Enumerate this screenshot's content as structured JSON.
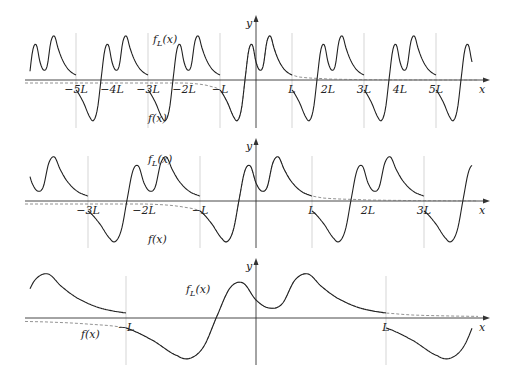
{
  "figure": {
    "panels": [
      {
        "id": "panel-1",
        "axis_y": 80,
        "origin_x": 256,
        "L_px": 36,
        "y_top": 15,
        "y_bottom": 128,
        "x_left": 25,
        "x_right": 490,
        "tick_labels": [
          "−5L",
          "−4L",
          "−3L",
          "−2L",
          "−L",
          "L",
          "2L",
          "3L",
          "4L",
          "5L"
        ],
        "tick_multiples": [
          -5,
          -4,
          -3,
          -2,
          -1,
          1,
          2,
          3,
          4,
          5
        ],
        "grid_multiples": [
          -5,
          -3,
          -1,
          1,
          3,
          5
        ],
        "fL_label": "f_L(x)",
        "fL_label_pos": [
          153,
          43
        ],
        "f_label": "f(x)",
        "f_label_pos": [
          148,
          122
        ],
        "y_label": "y",
        "x_label": "x"
      },
      {
        "id": "panel-2",
        "axis_y": 201,
        "origin_x": 256,
        "L_px": 56,
        "y_top": 138,
        "y_bottom": 248,
        "x_left": 25,
        "x_right": 490,
        "tick_labels": [
          "−3L",
          "−2L",
          "−L",
          "L",
          "2L",
          "3L"
        ],
        "tick_multiples": [
          -3,
          -2,
          -1,
          1,
          2,
          3
        ],
        "grid_multiples": [
          -3,
          -1,
          1,
          3
        ],
        "fL_label": "f_L(x)",
        "fL_label_pos": [
          148,
          163
        ],
        "f_label": "f(x)",
        "f_label_pos": [
          148,
          243
        ],
        "y_label": "y",
        "x_label": "x"
      },
      {
        "id": "panel-3",
        "axis_y": 318,
        "origin_x": 256,
        "L_px": 130,
        "y_top": 258,
        "y_bottom": 365,
        "x_left": 25,
        "x_right": 490,
        "tick_labels": [
          "−L",
          "L"
        ],
        "tick_multiples": [
          -1,
          1
        ],
        "grid_multiples": [
          -1,
          1
        ],
        "fL_label": "f_L(x)",
        "fL_label_pos": [
          186,
          293
        ],
        "f_label": "f(x)",
        "f_label_pos": [
          81,
          338
        ],
        "y_label": "y",
        "x_label": "x"
      }
    ],
    "function_f": {
      "note": "f(x) sampled in units where x is in multiples of L3 (panel-3 L) and y in px above axis for panel 3",
      "points_x": [
        -2.0,
        -1.6,
        -1.3,
        -1.0,
        -0.8,
        -0.6,
        -0.5,
        -0.4,
        -0.3,
        -0.2,
        -0.1,
        0.0,
        0.1,
        0.2,
        0.3,
        0.4,
        0.5,
        0.6,
        0.7,
        0.8,
        0.9,
        1.0,
        1.2,
        1.5,
        1.8,
        2.0
      ],
      "points_y": [
        -3,
        -4,
        -6,
        -10,
        -22,
        -38,
        -40,
        -28,
        2,
        30,
        35,
        18,
        10,
        14,
        38,
        44,
        32,
        22,
        15,
        10,
        7,
        5,
        3,
        2,
        1.5,
        1
      ]
    },
    "colors": {
      "curve": "#222222",
      "dashed": "#777777",
      "grid": "#bbbbbb",
      "axis": "#333333"
    }
  }
}
